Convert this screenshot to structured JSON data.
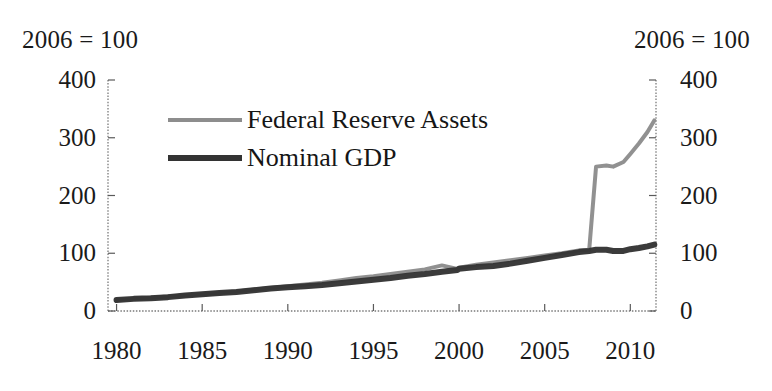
{
  "headers": {
    "left_index_note": "2006 = 100",
    "right_index_note": "2006 = 100"
  },
  "legend": {
    "items": [
      {
        "label": "Federal Reserve Assets",
        "color": "#8d8d8d",
        "key": "federal-reserve-assets"
      },
      {
        "label": "Nominal GDP",
        "color": "#333333",
        "key": "nominal-gdp"
      }
    ]
  },
  "axes": {
    "y_left_ticks": [
      "400",
      "300",
      "200",
      "100",
      "0"
    ],
    "y_right_ticks": [
      "400",
      "300",
      "200",
      "100",
      "0"
    ],
    "x_ticks": [
      "1980",
      "1985",
      "1990",
      "1995",
      "2000",
      "2005",
      "2010"
    ]
  },
  "chart_data": {
    "type": "line",
    "title": "",
    "subtitle": "",
    "xlabel": "",
    "ylabel": "2006 = 100",
    "y2label": "2006 = 100",
    "xlim": [
      1979.5,
      2011.5
    ],
    "ylim": [
      0,
      400
    ],
    "ytick_values": [
      0,
      100,
      200,
      300,
      400
    ],
    "xtick_values": [
      1980,
      1985,
      1990,
      1995,
      2000,
      2005,
      2010
    ],
    "grid": false,
    "legend_position": "upper-left-inside",
    "x": [
      1980,
      1981,
      1982,
      1983,
      1984,
      1985,
      1986,
      1987,
      1988,
      1989,
      1990,
      1991,
      1992,
      1993,
      1994,
      1995,
      1996,
      1997,
      1998,
      1999,
      1999.9,
      2000,
      2001,
      2002,
      2003,
      2004,
      2005,
      2006,
      2007,
      2007.6,
      2008,
      2008.6,
      2009,
      2009.6,
      2010,
      2010.5,
      2011,
      2011.4
    ],
    "series": [
      {
        "name": "Federal Reserve Assets",
        "color": "#8d8d8d",
        "linewidth": 4,
        "values": [
          19,
          21,
          23,
          25,
          27,
          29,
          31,
          34,
          37,
          40,
          43,
          46,
          49,
          53,
          57,
          60,
          64,
          68,
          72,
          79,
          73,
          75,
          80,
          84,
          88,
          92,
          96,
          100,
          105,
          106,
          250,
          252,
          250,
          258,
          272,
          290,
          310,
          330
        ]
      },
      {
        "name": "Nominal GDP",
        "color": "#333333",
        "linewidth": 6,
        "values": [
          19,
          21,
          22,
          24,
          27,
          29,
          31,
          33,
          36,
          39,
          41,
          43,
          45,
          48,
          51,
          54,
          57,
          61,
          64,
          68,
          71,
          73,
          76,
          78,
          82,
          87,
          92,
          97,
          102,
          104,
          106,
          106,
          104,
          104,
          107,
          109,
          112,
          115
        ]
      }
    ],
    "annotations": [
      {
        "text": "Federal Reserve Assets jump sharply in 2008",
        "x": 2008,
        "y": 250
      }
    ]
  }
}
